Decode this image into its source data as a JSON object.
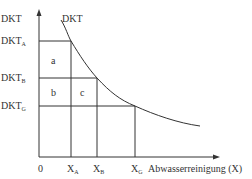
{
  "diagram": {
    "y_axis_label": "DKT",
    "curve_label": "DKT",
    "x_axis_label": "Abwasserreinigung (X)",
    "origin_label": "0",
    "y_levels": [
      {
        "base": "DKT",
        "sub": "A"
      },
      {
        "base": "DKT",
        "sub": "B"
      },
      {
        "base": "DKT",
        "sub": "G"
      }
    ],
    "x_levels": [
      {
        "base": "X",
        "sub": "A"
      },
      {
        "base": "X",
        "sub": "B"
      },
      {
        "base": "X",
        "sub": "G"
      }
    ],
    "areas": [
      "a",
      "b",
      "c"
    ],
    "line_color": "#333333"
  }
}
